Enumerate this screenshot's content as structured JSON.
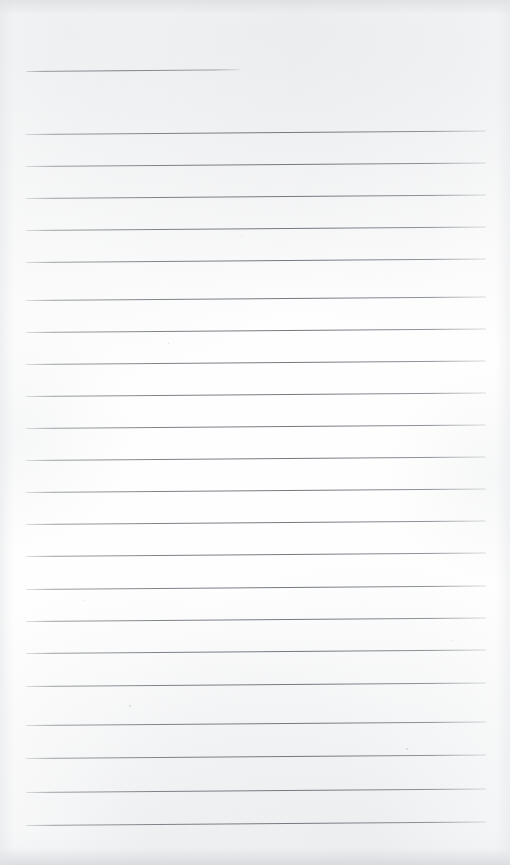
{
  "document": {
    "type": "scanned-ruled-notebook-page",
    "title": "Blank ruled page",
    "text_content": "",
    "page_width": 510,
    "page_height": 865,
    "background_color": "#fefefe",
    "rule_color": "#6c727a",
    "edge_shadow_color": "#d6d9dc"
  },
  "ruling": {
    "line_count": 24,
    "left_margin_x": 26,
    "right_margin_x": 486,
    "nominal_spacing": 32,
    "tilt_degrees": -0.45,
    "lines": [
      {
        "index": 1,
        "y": 71,
        "x_start": 26,
        "x_end": 241,
        "style": "short"
      },
      {
        "index": 2,
        "y": 134,
        "x_start": 26,
        "x_end": 486,
        "style": "full"
      },
      {
        "index": 3,
        "y": 166,
        "x_start": 26,
        "x_end": 486,
        "style": "full"
      },
      {
        "index": 4,
        "y": 198,
        "x_start": 26,
        "x_end": 486,
        "style": "full"
      },
      {
        "index": 5,
        "y": 230,
        "x_start": 26,
        "x_end": 486,
        "style": "full"
      },
      {
        "index": 6,
        "y": 262,
        "x_start": 26,
        "x_end": 486,
        "style": "full"
      },
      {
        "index": 7,
        "y": 300,
        "x_start": 26,
        "x_end": 486,
        "style": "full"
      },
      {
        "index": 8,
        "y": 332,
        "x_start": 26,
        "x_end": 486,
        "style": "full"
      },
      {
        "index": 9,
        "y": 364,
        "x_start": 26,
        "x_end": 486,
        "style": "full"
      },
      {
        "index": 10,
        "y": 396,
        "x_start": 26,
        "x_end": 486,
        "style": "full"
      },
      {
        "index": 11,
        "y": 428,
        "x_start": 26,
        "x_end": 486,
        "style": "full"
      },
      {
        "index": 12,
        "y": 460,
        "x_start": 26,
        "x_end": 486,
        "style": "full"
      },
      {
        "index": 13,
        "y": 492,
        "x_start": 26,
        "x_end": 486,
        "style": "full"
      },
      {
        "index": 14,
        "y": 524,
        "x_start": 26,
        "x_end": 486,
        "style": "full"
      },
      {
        "index": 15,
        "y": 556,
        "x_start": 26,
        "x_end": 486,
        "style": "full"
      },
      {
        "index": 16,
        "y": 589,
        "x_start": 26,
        "x_end": 486,
        "style": "full"
      },
      {
        "index": 17,
        "y": 621,
        "x_start": 26,
        "x_end": 486,
        "style": "full"
      },
      {
        "index": 18,
        "y": 653,
        "x_start": 26,
        "x_end": 486,
        "style": "full"
      },
      {
        "index": 19,
        "y": 686,
        "x_start": 26,
        "x_end": 486,
        "style": "full"
      },
      {
        "index": 20,
        "y": 725,
        "x_start": 26,
        "x_end": 486,
        "style": "full"
      },
      {
        "index": 21,
        "y": 758,
        "x_start": 26,
        "x_end": 486,
        "style": "full"
      },
      {
        "index": 22,
        "y": 792,
        "x_start": 26,
        "x_end": 486,
        "style": "full"
      },
      {
        "index": 23,
        "y": 825,
        "x_start": 26,
        "x_end": 486,
        "style": "full"
      }
    ]
  },
  "artifacts": {
    "specks": [
      {
        "x": 129,
        "y": 705,
        "size": 2
      },
      {
        "x": 406,
        "y": 748,
        "size": 2
      },
      {
        "x": 168,
        "y": 343,
        "size": 1
      },
      {
        "x": 83,
        "y": 600,
        "size": 1
      },
      {
        "x": 452,
        "y": 640,
        "size": 1
      },
      {
        "x": 241,
        "y": 236,
        "size": 1
      }
    ]
  }
}
